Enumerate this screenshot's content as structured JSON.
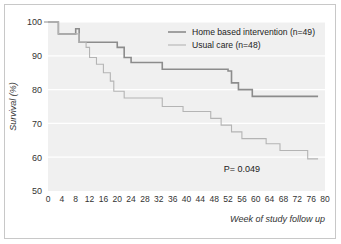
{
  "chart_data": {
    "type": "line",
    "subtype": "kaplan-meier-step",
    "title": "",
    "xlabel": "Week of study follow up",
    "ylabel": "Survival (%)",
    "xlim": [
      0,
      80
    ],
    "ylim": [
      50,
      100
    ],
    "xticks": [
      0,
      4,
      8,
      12,
      16,
      20,
      24,
      28,
      32,
      36,
      40,
      44,
      48,
      52,
      56,
      60,
      64,
      68,
      72,
      76,
      80
    ],
    "yticks": [
      50,
      60,
      70,
      80,
      90,
      100
    ],
    "grid": "horizontal-white-gridlines",
    "plot_background": "#f0f0f0",
    "legend_position": "top-right-inside",
    "annotations": [
      {
        "name": "p-value",
        "text": "P= 0.049",
        "x": 56,
        "y": 55.5
      }
    ],
    "series": [
      {
        "name": "Home based intervention (n=49)",
        "label": "Home based intervention (n=49)",
        "n": 49,
        "color": "#8c8c8c",
        "width": 1.6,
        "points": [
          [
            0,
            100
          ],
          [
            3,
            100
          ],
          [
            3,
            96.5
          ],
          [
            8,
            96.5
          ],
          [
            8,
            98
          ],
          [
            9,
            98
          ],
          [
            9,
            94
          ],
          [
            11,
            94
          ],
          [
            11,
            94
          ],
          [
            20,
            94
          ],
          [
            20,
            92.5
          ],
          [
            22,
            92.5
          ],
          [
            22,
            89.5
          ],
          [
            24,
            89.5
          ],
          [
            24,
            88
          ],
          [
            33,
            88
          ],
          [
            33,
            86
          ],
          [
            52,
            86
          ],
          [
            52,
            85.5
          ],
          [
            53,
            85.5
          ],
          [
            53,
            82
          ],
          [
            55,
            82
          ],
          [
            55,
            80
          ],
          [
            59,
            80
          ],
          [
            59,
            78
          ],
          [
            78,
            78
          ]
        ]
      },
      {
        "name": "Usual care (n=48)",
        "label": "Usual care (n=48)",
        "n": 48,
        "color": "#b4b4b4",
        "width": 1.1,
        "points": [
          [
            0,
            100
          ],
          [
            3,
            100
          ],
          [
            3,
            96.5
          ],
          [
            9,
            96.5
          ],
          [
            9,
            94
          ],
          [
            11,
            94
          ],
          [
            11,
            92.5
          ],
          [
            12,
            92.5
          ],
          [
            12,
            89.5
          ],
          [
            14,
            89.5
          ],
          [
            14,
            87.5
          ],
          [
            16,
            87.5
          ],
          [
            16,
            85
          ],
          [
            18,
            85
          ],
          [
            18,
            82.5
          ],
          [
            19,
            82.5
          ],
          [
            19,
            79.5
          ],
          [
            22,
            79.5
          ],
          [
            22,
            77.5
          ],
          [
            33,
            77.5
          ],
          [
            33,
            75
          ],
          [
            39,
            75
          ],
          [
            39,
            73.5
          ],
          [
            47,
            73.5
          ],
          [
            47,
            71.5
          ],
          [
            50,
            71.5
          ],
          [
            50,
            69.5
          ],
          [
            53,
            69.5
          ],
          [
            53,
            67.5
          ],
          [
            56,
            67.5
          ],
          [
            56,
            65.5
          ],
          [
            63,
            65.5
          ],
          [
            63,
            64
          ],
          [
            67,
            64
          ],
          [
            67,
            62
          ],
          [
            75,
            62
          ],
          [
            75,
            59.5
          ],
          [
            78,
            59.5
          ]
        ]
      }
    ]
  },
  "axes": {
    "ylabel": "Survival (%)",
    "xlabel": "Week of study follow up",
    "ytick_labels": [
      "100",
      "90",
      "80",
      "70",
      "60",
      "50"
    ],
    "xtick_labels": [
      "0",
      "4",
      "8",
      "12",
      "16",
      "20",
      "24",
      "28",
      "32",
      "36",
      "40",
      "44",
      "48",
      "52",
      "56",
      "60",
      "64",
      "68",
      "72",
      "76",
      "80"
    ]
  },
  "legend": {
    "items": [
      {
        "label": "Home based intervention (n=49)",
        "color": "#8c8c8c"
      },
      {
        "label": "Usual care (n=48)",
        "color": "#b4b4b4"
      }
    ]
  },
  "stats": {
    "p_value_text": "P= 0.049"
  }
}
